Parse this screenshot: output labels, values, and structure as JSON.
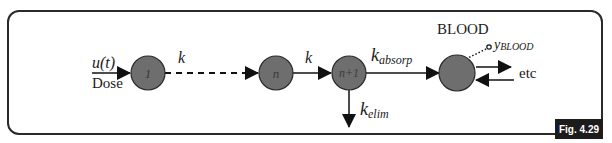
{
  "figure": {
    "badge": "Fig. 4.29",
    "colors": {
      "node_fill": "#6e6e6e",
      "node_stroke": "#2a2a2a",
      "line": "#111111",
      "frame": "#2a2a2a",
      "badge_bg": "#1c1c1c",
      "badge_text": "#ffffff"
    }
  },
  "input": {
    "signal": "u(t)",
    "label": "Dose"
  },
  "nodes": [
    {
      "id": "1",
      "label": "1"
    },
    {
      "id": "n",
      "label": "n"
    },
    {
      "id": "n+1",
      "label": "n+1"
    },
    {
      "id": "blood",
      "label": "",
      "title": "BLOOD"
    }
  ],
  "edges": {
    "dashed_rate": "k",
    "n_to_n1_rate": "k",
    "absorb_rate_base": "k",
    "absorb_rate_sub": "absorp",
    "elim_rate_base": "k",
    "elim_rate_sub": "elim"
  },
  "output": {
    "base": "y",
    "sub": "BLOOD",
    "exchange_label": "etc"
  }
}
